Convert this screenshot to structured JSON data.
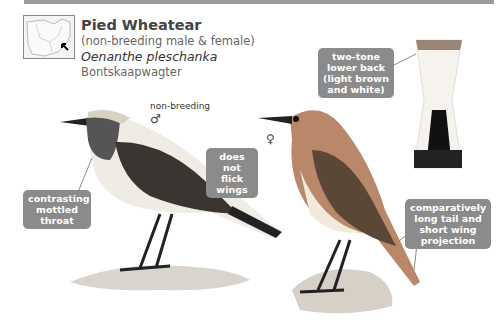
{
  "header": {
    "common_name": "Pied Wheatear",
    "plumage_note": "(non-breeding male & female)",
    "scientific_name": "Oenanthe pleschanka",
    "afrikaans_name": "Bontskaapwagter"
  },
  "map": {
    "icon": "distribution-map-icon",
    "arrow": "arrow-pointer-icon"
  },
  "figures": {
    "male": {
      "label": "non-breeding",
      "symbol": "♂"
    },
    "female": {
      "symbol": "♀"
    }
  },
  "callouts": {
    "throat": "contrasting mottled throat",
    "wings": "does not flick wings",
    "back": "two-tone lower back (light brown and white)",
    "tail": "comparatively long tail and short wing projection"
  },
  "colors": {
    "callout_bg": "#8b8b8b",
    "callout_text": "#ffffff",
    "rule": "#9a9a9a"
  }
}
